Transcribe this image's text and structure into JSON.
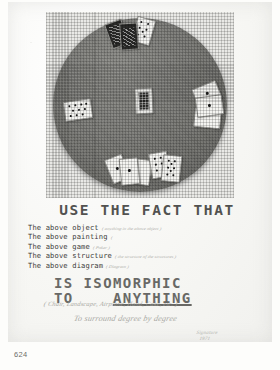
{
  "page": {
    "page_number": "624",
    "background_color": "#fdfdfb",
    "paper_color": "#f5f5f2"
  },
  "photograph": {
    "caption_semantic": "round card table with playing card hands",
    "table_color": "#73736f",
    "card_color": "#f4f4f1",
    "hands": [
      {
        "position": "top",
        "cards": [
          "face-card",
          "face-card",
          "seven-of-spades"
        ]
      },
      {
        "position": "left",
        "cards": [
          "ten-of-clubs"
        ]
      },
      {
        "position": "center",
        "cards": [
          "court-card"
        ]
      },
      {
        "position": "right",
        "cards": [
          "ace-of-spades",
          "ace-of-spades",
          "blank-card"
        ]
      },
      {
        "position": "bottom-left",
        "cards": [
          "ace-of-hearts",
          "ace-of-spades",
          "low-card"
        ]
      },
      {
        "position": "bottom-right",
        "cards": [
          "six-of-spades",
          "eight-of-spades"
        ]
      }
    ]
  },
  "headline": {
    "text": "USE THE FACT THAT"
  },
  "above_list": [
    {
      "label": "The above object",
      "note": "( anything in the above object )"
    },
    {
      "label": "The above painting",
      "note": "("
    },
    {
      "label": "The above game",
      "note": "( Poker )"
    },
    {
      "label": "The above structure",
      "note": "( the structure of the structures )"
    },
    {
      "label": "The above diagram",
      "note": "( Diagram )"
    }
  ],
  "statement": {
    "line_one": "IS  ISOMORPHIC",
    "line_two_prefix": "TO",
    "line_two_emphasis": "ANYTHING"
  },
  "handwritten": {
    "examples": "( Chair, Landscape, Airplane, Hand, Cake, etc. )",
    "motto": "To surround degree by degree",
    "signature": "Signature",
    "signature_date": "1971"
  }
}
